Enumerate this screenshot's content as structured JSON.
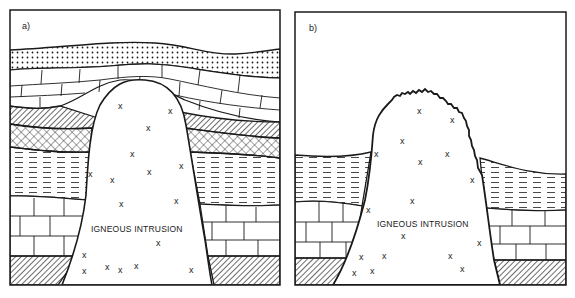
{
  "panels": [
    {
      "id": "a",
      "label": "a)",
      "caption": "IGNEOUS INTRUSION",
      "description": "Intrusion domes overlying strata; layers bend over the top of the intrusion",
      "layers_top_to_bottom": [
        "sandstone (dotted)",
        "limestone (brick)",
        "hatched bed",
        "cross-hatched bed",
        "shale (dashed)",
        "limestone (brick)",
        "hatched basement"
      ]
    },
    {
      "id": "b",
      "label": "b)",
      "caption": "IGNEOUS INTRUSION",
      "description": "Eroded surface; intrusion exposed with weathered (jagged) top",
      "layers_top_to_bottom": [
        "shale (dashed)",
        "limestone (brick)",
        "hatched basement"
      ]
    }
  ],
  "marker_symbol": "x",
  "colors": {
    "ink": "#1a1a1a",
    "paper": "#ffffff"
  }
}
